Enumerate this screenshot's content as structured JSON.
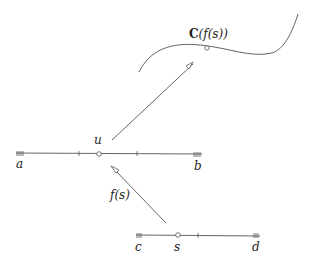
{
  "diagram": {
    "labels": {
      "curve_point": "C(f(s))",
      "curve_point_bold": "C",
      "curve_point_rest": "(f(s))",
      "u": "u",
      "a": "a",
      "b": "b",
      "f_of_s": "f(s)",
      "c": "c",
      "s": "s",
      "d": "d"
    },
    "axes": [
      {
        "name": "u-interval",
        "left_label": "a",
        "right_label": "b",
        "marked_point": "u"
      },
      {
        "name": "s-interval",
        "left_label": "c",
        "right_label": "d",
        "marked_point": "s"
      }
    ],
    "arrows": [
      {
        "from": "s",
        "to": "u",
        "label": "f(s)"
      },
      {
        "from": "u",
        "to": "C(f(s))",
        "label": ""
      }
    ],
    "colors": {
      "stroke": "#555555",
      "text": "#222222",
      "background": "#ffffff"
    }
  }
}
